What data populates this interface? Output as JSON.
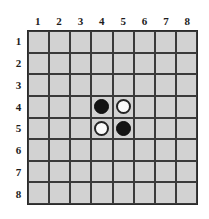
{
  "board": {
    "game": "Othello",
    "size": 8,
    "column_labels": [
      "1",
      "2",
      "3",
      "4",
      "5",
      "6",
      "7",
      "8"
    ],
    "row_labels": [
      "1",
      "2",
      "3",
      "4",
      "5",
      "6",
      "7",
      "8"
    ],
    "colors": {
      "background": "#ffffff",
      "cell_fill": "#d2d2d2",
      "grid_line": "#3a3a3a",
      "border": "#2b2b2b",
      "label_text": "#1c1c1c",
      "black_stone": "#141414",
      "white_stone": "#fafafa",
      "white_stone_outline": "#242424"
    },
    "cells": [
      [
        "empty",
        "empty",
        "empty",
        "empty",
        "empty",
        "empty",
        "empty",
        "empty"
      ],
      [
        "empty",
        "empty",
        "empty",
        "empty",
        "empty",
        "empty",
        "empty",
        "empty"
      ],
      [
        "empty",
        "empty",
        "empty",
        "empty",
        "empty",
        "empty",
        "empty",
        "empty"
      ],
      [
        "empty",
        "empty",
        "empty",
        "black",
        "white",
        "empty",
        "empty",
        "empty"
      ],
      [
        "empty",
        "empty",
        "empty",
        "white",
        "black",
        "empty",
        "empty",
        "empty"
      ],
      [
        "empty",
        "empty",
        "empty",
        "empty",
        "empty",
        "empty",
        "empty",
        "empty"
      ],
      [
        "empty",
        "empty",
        "empty",
        "empty",
        "empty",
        "empty",
        "empty",
        "empty"
      ],
      [
        "empty",
        "empty",
        "empty",
        "empty",
        "empty",
        "empty",
        "empty",
        "empty"
      ]
    ],
    "stones": [
      {
        "row": 4,
        "column": 4,
        "color": "black"
      },
      {
        "row": 4,
        "column": 5,
        "color": "white"
      },
      {
        "row": 5,
        "column": 4,
        "color": "white"
      },
      {
        "row": 5,
        "column": 5,
        "color": "black"
      }
    ]
  }
}
